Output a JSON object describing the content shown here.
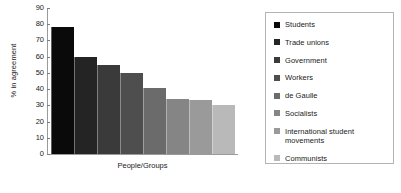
{
  "chart_data": {
    "type": "bar",
    "title": "",
    "subtitle": "",
    "xlabel": "People/Groups",
    "ylabel": "% in agreement",
    "ylim": [
      0,
      90
    ],
    "yticks": [
      90,
      80,
      70,
      60,
      50,
      40,
      30,
      20,
      10,
      0
    ],
    "grid": false,
    "legend_position": "right",
    "categories": [
      "Students",
      "Trade unions",
      "Government",
      "Workers",
      "de Gaulle",
      "Socialists",
      "International student movements",
      "Communists"
    ],
    "values": [
      78,
      60,
      55,
      50,
      41,
      34,
      33,
      30
    ],
    "colors": [
      "#0a0a0a",
      "#242424",
      "#3a3a3a",
      "#4e4e4e",
      "#6b6b6b",
      "#858585",
      "#9a9a9a",
      "#b9b9b9"
    ]
  },
  "legend": {
    "entries": [
      {
        "label": "Students",
        "color": "#0a0a0a"
      },
      {
        "label": "Trade unions",
        "color": "#242424"
      },
      {
        "label": "Government",
        "color": "#3a3a3a"
      },
      {
        "label": "Workers",
        "color": "#4e4e4e"
      },
      {
        "label": "de Gaulle",
        "color": "#6b6b6b"
      },
      {
        "label": "Socialists",
        "color": "#858585"
      },
      {
        "label": "International student movements",
        "color": "#9a9a9a"
      },
      {
        "label": "Communists",
        "color": "#b9b9b9"
      }
    ]
  }
}
